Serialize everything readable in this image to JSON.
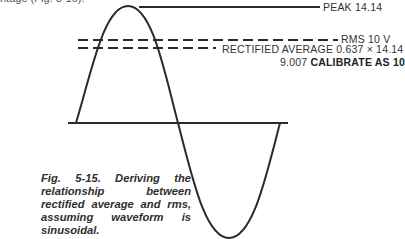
{
  "figure": {
    "number": "Fig. 5-15.",
    "caption": "Deriving the relationship between rectified average and rms, assuming waveform is sinusoidal.",
    "cropped_top_text": "ntage (Fig. 5-16)."
  },
  "labels": {
    "peak": "PEAK 14.14",
    "rms": "RMS 10 V",
    "rectified_average": "RECTIFIED AVERAGE 0.637 × 14.14",
    "result_value": "9.007",
    "calibrate": "CALIBRATE AS 10"
  },
  "waveform": {
    "type": "sine",
    "peak": 14.14,
    "rms": 10,
    "rectified_average_factor": 0.637,
    "rectified_average": 9.007,
    "calibrated_reading": 10
  },
  "colors": {
    "line": "#2a2a2a",
    "background": "#ffffff"
  }
}
